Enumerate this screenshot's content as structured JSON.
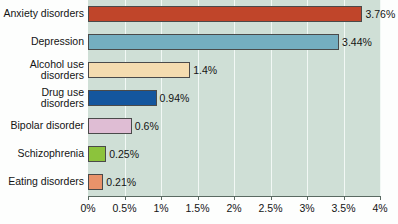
{
  "chart_data": {
    "type": "bar",
    "orientation": "horizontal",
    "title": "",
    "xlabel": "",
    "ylabel": "",
    "xlim": [
      0,
      4
    ],
    "grid": true,
    "legend": false,
    "categories": [
      "Anxiety disorders",
      "Depression",
      "Alcohol use\ndisorders",
      "Drug use\ndisorders",
      "Bipolar disorder",
      "Schizophrenia",
      "Eating disorders"
    ],
    "values": [
      3.76,
      3.44,
      1.4,
      0.94,
      0.6,
      0.25,
      0.21
    ],
    "value_labels": [
      "3.76%",
      "3.44%",
      "1.4%",
      "0.94%",
      "0.6%",
      "0.25%",
      "0.21%"
    ],
    "bar_colors": [
      "#c0452a",
      "#74aec0",
      "#f4dcb0",
      "#14569e",
      "#dfbdd4",
      "#8cc33c",
      "#e8926a"
    ],
    "tick_values": [
      0,
      0.5,
      1,
      1.5,
      2,
      2.5,
      3,
      3.5,
      4
    ],
    "tick_labels": [
      "0%",
      "0.5%",
      "1%",
      "1.5%",
      "2%",
      "2.5%",
      "3%",
      "3.5%",
      "4%"
    ],
    "plot_background": "#cfdfd6",
    "gridline_color": "#f2f8f5",
    "axis_color": "#5a6a62",
    "bar_border_color": "#4a4a4a"
  }
}
